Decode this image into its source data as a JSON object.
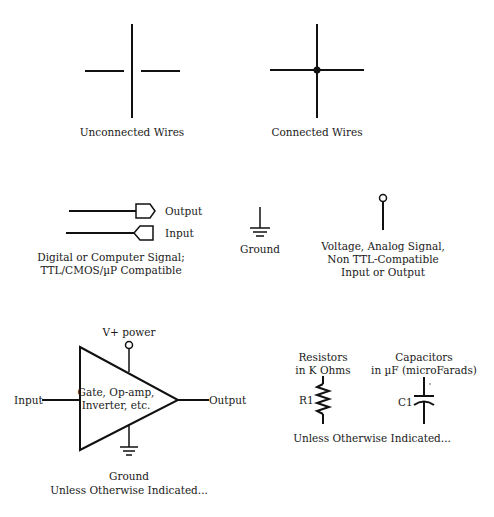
{
  "unconnected": {
    "label": "Unconnected Wires"
  },
  "connected": {
    "label": "Connected Wires"
  },
  "digital": {
    "output_label": "Output",
    "input_label": "Input",
    "caption_line1": "Digital or Computer Signal;",
    "caption_line2": "TTL/CMOS/µP Compatible"
  },
  "ground": {
    "label": "Ground"
  },
  "analog": {
    "caption_line1": "Voltage, Analog Signal,",
    "caption_line2": "Non TTL-Compatible",
    "caption_line3": "Input or Output"
  },
  "amplifier": {
    "power_label": "V+ power",
    "input_label": "Input",
    "output_label": "Output",
    "body_line1": "Gate, Op-amp,",
    "body_line2": "Inverter, etc.",
    "ground_label": "Ground",
    "note": "Unless Otherwise Indicated..."
  },
  "components": {
    "resistor_title1": "Resistors",
    "resistor_title2": "in K Ohms",
    "resistor_ref": "R1",
    "capacitor_title1": "Capacitors",
    "capacitor_title2": "in µF (microFarads)",
    "capacitor_ref": "C1",
    "note": "Unless Otherwise Indicated..."
  }
}
